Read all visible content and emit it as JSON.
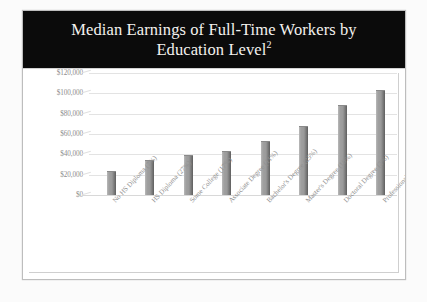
{
  "title": {
    "line1": "Median Earnings of Full-Time Workers by",
    "line2": "Education Level",
    "superscript": "2"
  },
  "colors": {
    "title_banner_bg": "#0b0b0b",
    "title_text": "#f4f2ef",
    "bar_fill": "#9a9a9a",
    "bar_shadow": "#5e5e5e",
    "gridline": "#e3e3e3",
    "axis_text": "#8f8f8f",
    "panel_bg": "#ffffff",
    "frame_border": "#bdbdbd"
  },
  "chart_data": {
    "type": "bar",
    "title": "Median Earnings of Full-Time Workers by Education Level",
    "xlabel": "",
    "ylabel": "",
    "ylim": [
      0,
      120000
    ],
    "ytick_values": [
      0,
      20000,
      40000,
      60000,
      80000,
      100000,
      120000
    ],
    "ytick_labels": [
      "$0",
      "$20,000",
      "$40,000",
      "$60,000",
      "$80,000",
      "$100,000",
      "$120,000"
    ],
    "grid": true,
    "legend": false,
    "categories": [
      "No HS Diploma (7%)",
      "HS Diploma (27%)",
      "Some College (17%)",
      "Associate Degree (11%)",
      "Bachelor's Degree (25%)",
      "Master's Degree (10%)",
      "Doctoral Degree (2%)",
      "Professional Degree (2%)"
    ],
    "values": [
      23000,
      33000,
      38000,
      42000,
      52000,
      67000,
      88000,
      102000
    ]
  }
}
